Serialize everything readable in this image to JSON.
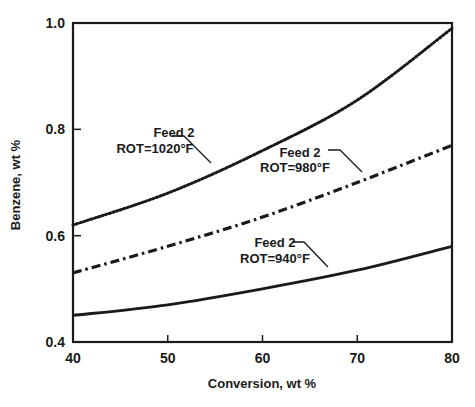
{
  "chart_data": {
    "type": "line",
    "title": "",
    "xlabel": "Conversion, wt %",
    "ylabel": "Benzene, wt %",
    "xlim": [
      40,
      80
    ],
    "ylim": [
      0.4,
      1.0
    ],
    "xticks": [
      40,
      50,
      60,
      70,
      80
    ],
    "yticks": [
      0.4,
      0.6,
      0.8,
      1.0
    ],
    "xtick_labels": [
      "40",
      "50",
      "60",
      "70",
      "80"
    ],
    "ytick_labels": [
      "0.4",
      "0.6",
      "0.8",
      "1.0"
    ],
    "grid": false,
    "legend": "none (inline annotations with leader lines)",
    "x": [
      40,
      50,
      60,
      70,
      80
    ],
    "series": [
      {
        "name": "Feed 2 ROT=1020°F",
        "line_style": "dotted",
        "values": [
          0.62,
          0.68,
          0.76,
          0.855,
          0.99
        ],
        "annotation": {
          "line1": "Feed 2",
          "line2": "ROT=1020°F"
        }
      },
      {
        "name": "Feed 2 ROT=980°F",
        "line_style": "dash-dot",
        "values": [
          0.53,
          0.58,
          0.635,
          0.7,
          0.77
        ],
        "annotation": {
          "line1": "Feed 2",
          "line2": "ROT=980°F"
        }
      },
      {
        "name": "Feed 2 ROT=940°F",
        "line_style": "solid",
        "values": [
          0.45,
          0.47,
          0.5,
          0.535,
          0.58
        ],
        "annotation": {
          "line1": "Feed 2",
          "line2": "ROT=940°F"
        }
      }
    ]
  },
  "colors": {
    "ink": "#1a1a1a",
    "background": "#ffffff"
  }
}
